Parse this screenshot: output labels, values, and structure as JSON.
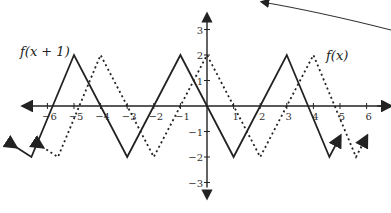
{
  "chart_data": {
    "type": "line",
    "title": "",
    "xlabel": "",
    "ylabel": "",
    "xlim": [
      -7,
      6.5
    ],
    "ylim": [
      -3.5,
      3.5
    ],
    "grid": false,
    "x_ticks": [
      -6,
      -5,
      -4,
      -3,
      -2,
      -1,
      1,
      2,
      3,
      4,
      5,
      6
    ],
    "y_ticks": [
      -3,
      -2,
      -1,
      1,
      2,
      3
    ],
    "x_tick_labels": [
      "−6",
      "−5",
      "−4",
      "−3",
      "−2",
      "−1",
      "1",
      "2",
      "3",
      "4",
      "5",
      "6"
    ],
    "y_tick_labels": [
      "−3",
      "−2",
      "−1",
      "1",
      "2",
      "3"
    ],
    "series": [
      {
        "name": "f(x+1)",
        "style": "solid",
        "x": [
          -7.2,
          -6.6,
          -5,
          -3,
          -1,
          1,
          3,
          4.6,
          5
        ],
        "y": [
          -1.6,
          -2,
          2,
          -2,
          2,
          -2,
          2,
          -2,
          -1.2
        ]
      },
      {
        "name": "f(x)",
        "style": "dotted",
        "x": [
          -6.2,
          -5.6,
          -4,
          -2,
          0,
          2,
          4,
          5.6,
          6
        ],
        "y": [
          -1.6,
          -2,
          2,
          -2,
          2,
          -2,
          2,
          -2,
          -1.2
        ]
      }
    ],
    "annotations": [
      {
        "text": "f(x + 1)",
        "near": "left peak of solid curve"
      },
      {
        "text": "f(x)",
        "near": "right peak of dotted curve"
      },
      {
        "text": "curved arrow",
        "near": "top right, pointing left"
      }
    ]
  },
  "labels": {
    "solid_curve": "f(x + 1)",
    "dotted_curve": "f(x)"
  }
}
